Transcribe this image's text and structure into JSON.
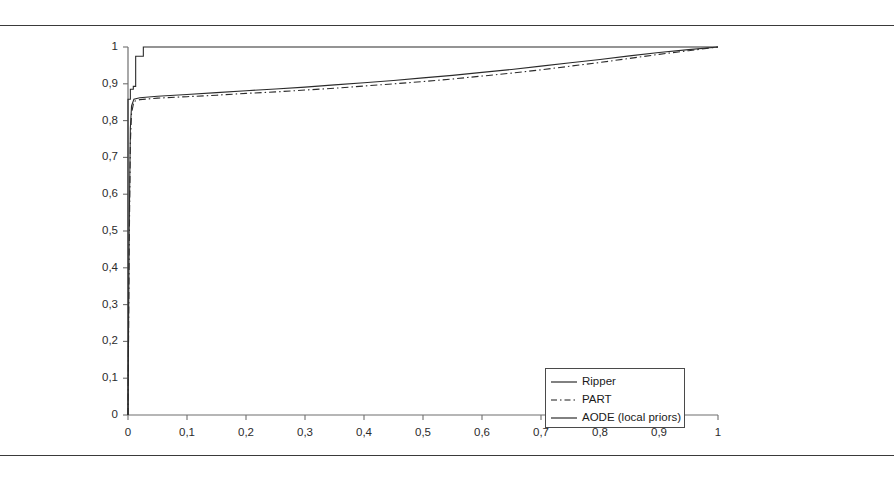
{
  "page": {
    "rule_top_label": "horizontal-rule-top",
    "rule_bottom_label": "horizontal-rule-bottom"
  },
  "chart_data": {
    "type": "line",
    "title": "",
    "subtitle": "",
    "xlabel": "",
    "ylabel": "",
    "xlim": [
      0,
      1
    ],
    "ylim": [
      0,
      1
    ],
    "grid": false,
    "legend_position": "lower-right-inside",
    "x_ticks": [
      "0",
      "0,1",
      "0,2",
      "0,3",
      "0,4",
      "0,5",
      "0,6",
      "0,7",
      "0,8",
      "0,9",
      "1"
    ],
    "x_tick_values": [
      0,
      0.1,
      0.2,
      0.3,
      0.4,
      0.5,
      0.6,
      0.7,
      0.8,
      0.9,
      1
    ],
    "y_ticks": [
      "0",
      "0,1",
      "0,2",
      "0,3",
      "0,4",
      "0,5",
      "0,6",
      "0,7",
      "0,8",
      "0,9",
      "1"
    ],
    "y_tick_values": [
      0,
      0.1,
      0.2,
      0.3,
      0.4,
      0.5,
      0.6,
      0.7,
      0.8,
      0.9,
      1
    ],
    "decimal_separator": ",",
    "series": [
      {
        "name": "Ripper",
        "style": "solid",
        "color": "#2b2b2b",
        "x": [
          0,
          0.002,
          0.004,
          0.006,
          0.01,
          0.02,
          0.05,
          0.1,
          0.15,
          0.2,
          0.25,
          0.3,
          0.35,
          0.4,
          0.45,
          0.5,
          0.55,
          0.6,
          0.65,
          0.7,
          0.75,
          0.8,
          0.85,
          0.9,
          0.95,
          1
        ],
        "y": [
          0,
          0.5,
          0.78,
          0.84,
          0.858,
          0.862,
          0.866,
          0.871,
          0.876,
          0.881,
          0.886,
          0.891,
          0.897,
          0.903,
          0.909,
          0.916,
          0.923,
          0.931,
          0.939,
          0.948,
          0.957,
          0.966,
          0.976,
          0.985,
          0.993,
          1
        ]
      },
      {
        "name": "PART",
        "style": "dash-dot",
        "color": "#2b2b2b",
        "x": [
          0,
          0.002,
          0.004,
          0.006,
          0.01,
          0.02,
          0.05,
          0.1,
          0.15,
          0.2,
          0.25,
          0.3,
          0.35,
          0.4,
          0.45,
          0.5,
          0.55,
          0.6,
          0.65,
          0.7,
          0.75,
          0.8,
          0.85,
          0.9,
          0.95,
          1
        ],
        "y": [
          0,
          0.45,
          0.74,
          0.82,
          0.852,
          0.857,
          0.861,
          0.865,
          0.869,
          0.874,
          0.878,
          0.883,
          0.888,
          0.894,
          0.9,
          0.906,
          0.913,
          0.921,
          0.929,
          0.938,
          0.948,
          0.958,
          0.969,
          0.98,
          0.99,
          1
        ]
      },
      {
        "name": "AODE (local priors)",
        "style": "solid-step",
        "color": "#2b2b2b",
        "x": [
          0,
          0.0,
          0.004,
          0.004,
          0.009,
          0.009,
          0.013,
          0.013,
          0.026,
          0.026,
          1
        ],
        "y": [
          0,
          0.858,
          0.858,
          0.885,
          0.885,
          0.893,
          0.893,
          0.975,
          0.975,
          1.0,
          1.0
        ]
      }
    ],
    "legend_entries": [
      {
        "label": "Ripper",
        "style": "solid"
      },
      {
        "label": "PART",
        "style": "dash-dot"
      },
      {
        "label": "AODE (local priors)",
        "style": "solid"
      }
    ]
  }
}
